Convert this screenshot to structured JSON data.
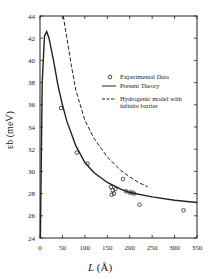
{
  "chart_data": {
    "type": "line",
    "title": "",
    "xlabel": "L (Å)",
    "ylabel": "εb (meV)",
    "xlim": [
      0,
      350
    ],
    "ylim": [
      24,
      44
    ],
    "xticks": [
      0,
      50,
      100,
      150,
      200,
      250,
      300,
      350
    ],
    "yticks": [
      24,
      26,
      28,
      30,
      32,
      34,
      36,
      38,
      40,
      42,
      44
    ],
    "grid": false,
    "legend_position": "upper right",
    "legend": [
      "Experimental Data",
      "Present Theory",
      "Hydrogenic model with infinite barrier"
    ],
    "series": [
      {
        "name": "Experimental Data",
        "style": "circles",
        "x": [
          47,
          82,
          106,
          158,
          162,
          165,
          168,
          160,
          185,
          192,
          200,
          205,
          210,
          222,
          320
        ],
        "y": [
          35.7,
          31.7,
          30.7,
          28.6,
          28.3,
          28.0,
          28.4,
          27.9,
          29.3,
          28.2,
          28.1,
          28.1,
          28.0,
          27.0,
          26.5
        ]
      },
      {
        "name": "Present Theory",
        "style": "solid",
        "x": [
          1,
          5,
          10,
          15,
          20,
          30,
          40,
          50,
          60,
          80,
          100,
          120,
          150,
          180,
          200,
          250,
          300,
          350
        ],
        "y": [
          24,
          38,
          42.2,
          42.6,
          42,
          40,
          37.8,
          36,
          34.5,
          32.3,
          30.8,
          29.9,
          29,
          28.4,
          28.1,
          27.7,
          27.4,
          27.2
        ]
      },
      {
        "name": "Hydrogenic model with infinite barrier",
        "style": "dashed",
        "x": [
          52,
          60,
          70,
          80,
          100,
          120,
          150,
          180,
          200,
          220,
          240
        ],
        "y": [
          44,
          42,
          39.5,
          37.3,
          34.6,
          33,
          31.3,
          30.1,
          29.5,
          29.0,
          28.6
        ]
      }
    ]
  },
  "legend_labels": {
    "exp": "Experimental Data",
    "theory": "Present Theory",
    "hydro1": "Hydrogenic model with",
    "hydro2": "infinite barrier"
  },
  "axis": {
    "xlabel_italic": "L",
    "xlabel_unit": "(Å)",
    "ylabel": "εb (meV)"
  }
}
